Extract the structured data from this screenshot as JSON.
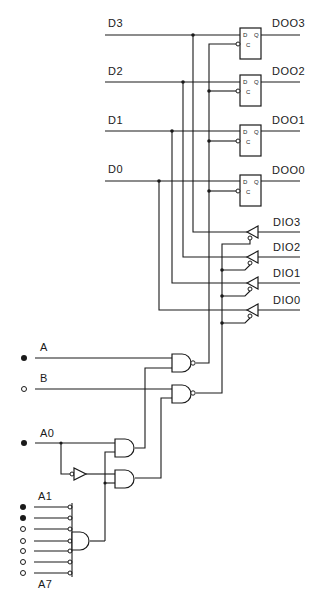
{
  "diagram": {
    "type": "logic-schematic",
    "colors": {
      "ink": "#1a1a1a",
      "background": "#ffffff"
    },
    "data_inputs": [
      {
        "label": "D3",
        "latch_output": "DOO3",
        "bus_line": "DIO3"
      },
      {
        "label": "D2",
        "latch_output": "DOO2",
        "bus_line": "DIO2"
      },
      {
        "label": "D1",
        "latch_output": "DOO1",
        "bus_line": "DIO1"
      },
      {
        "label": "D0",
        "latch_output": "DOO0",
        "bus_line": "DIO0"
      }
    ],
    "latch_pins": {
      "d": "D",
      "q": "Q",
      "c": "C"
    },
    "control_inputs": [
      {
        "label": "A",
        "state": "filled"
      },
      {
        "label": "B",
        "state": "open"
      },
      {
        "label": "A0",
        "state": "filled"
      }
    ],
    "address_inputs": {
      "first_label": "A1",
      "last_label": "A7",
      "states": [
        "filled",
        "filled",
        "open",
        "open",
        "open",
        "open",
        "open"
      ]
    },
    "gates": [
      {
        "type": "NAND",
        "inputs": [
          "A",
          "AND-1 out"
        ],
        "drives": "latch clocks"
      },
      {
        "type": "NAND",
        "inputs": [
          "B",
          "AND-2 out"
        ],
        "drives": "tri-state enables"
      },
      {
        "type": "AND",
        "name": "AND-1",
        "inputs": [
          "A0",
          "address-decode"
        ]
      },
      {
        "type": "AND",
        "name": "AND-2",
        "inputs": [
          "NOT A0",
          "address-decode"
        ]
      },
      {
        "type": "NOT",
        "input": "A0"
      },
      {
        "type": "AND",
        "name": "address-decode",
        "inputs": [
          "A1'",
          "A2'",
          "A3'",
          "A4'",
          "A5'",
          "A6'",
          "A7'"
        ]
      }
    ]
  }
}
